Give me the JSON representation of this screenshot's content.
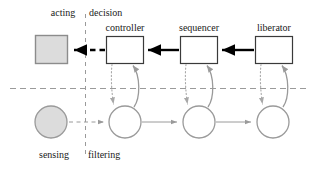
{
  "diagram": {
    "type": "block-diagram",
    "title": "",
    "axes": {
      "vertical_divider": {
        "name": "decision-boundary",
        "x": 85,
        "y1": 14,
        "y2": 155,
        "style": "dashed",
        "color": "#9a9a9a",
        "left_label_top": "acting",
        "right_label_top": "decision",
        "left_label_bottom": "sensing",
        "right_label_bottom": "filtering"
      },
      "horizontal_divider": {
        "name": "layer-boundary",
        "y": 88,
        "x1": 10,
        "x2": 306,
        "style": "dashed",
        "color": "#9a9a9a"
      }
    },
    "labels": {
      "acting": "acting",
      "decision": "decision",
      "sensing": "sensing",
      "filtering": "filtering"
    },
    "top_row": {
      "name": "actuator-row",
      "actuator": {
        "label": "",
        "shape": "square",
        "fill": "#dcdcdc",
        "stroke": "#8c8c8c",
        "x": 35,
        "y": 35,
        "w": 32,
        "h": 28
      },
      "boxes": [
        {
          "label": "controller",
          "x": 106,
          "y": 36,
          "w": 37,
          "h": 27
        },
        {
          "label": "sequencer",
          "x": 180,
          "y": 36,
          "w": 37,
          "h": 27
        },
        {
          "label": "liberator",
          "x": 255,
          "y": 36,
          "w": 38,
          "h": 27
        }
      ],
      "box_fill": "#ffffff",
      "box_stroke": "#3a3a3a"
    },
    "bottom_row": {
      "name": "sensor-row",
      "sensor": {
        "label": "",
        "shape": "circle",
        "fill": "#dcdcdc",
        "stroke": "#9a9a9a",
        "cx": 51,
        "cy": 122,
        "r": 16
      },
      "circles": [
        {
          "label": "",
          "cx": 125,
          "cy": 122,
          "r": 16
        },
        {
          "label": "",
          "cx": 199,
          "cy": 122,
          "r": 16
        },
        {
          "label": "",
          "cx": 273,
          "cy": 122,
          "r": 16
        }
      ],
      "circle_fill": "#ffffff",
      "circle_stroke": "#9a9a9a"
    },
    "connections": {
      "top_flow_direction": "right-to-left",
      "bottom_flow_direction": "left-to-right",
      "top_arrows": {
        "name": "command-arrow",
        "style": "solid",
        "color": "#000000",
        "width": 2.4,
        "count": 2
      },
      "actuator_arrow": {
        "name": "acting-arrow",
        "style": "dashed",
        "color": "#000000",
        "width": 2.4
      },
      "bottom_arrows": {
        "name": "percept-arrow",
        "style": "solid",
        "color": "#9a9a9a",
        "width": 1,
        "count": 2
      },
      "sensor_arrow": {
        "name": "sensing-arrow",
        "style": "dashed",
        "color": "#9a9a9a",
        "width": 1
      },
      "down_arrows": {
        "name": "box-to-circle-arrow",
        "style": "dotted",
        "color": "#a8a8a8",
        "width": 1,
        "count": 3
      },
      "up_arrows": {
        "name": "circle-to-box-arrow",
        "style": "solid",
        "color": "#9a9a9a",
        "width": 1.3,
        "count": 3
      }
    },
    "colors": {
      "grayfill": "#dcdcdc",
      "graystroke": "#9a9a9a",
      "darkstroke": "#3a3a3a",
      "black": "#000000",
      "dotted": "#a8a8a8",
      "background": "#ffffff"
    }
  }
}
